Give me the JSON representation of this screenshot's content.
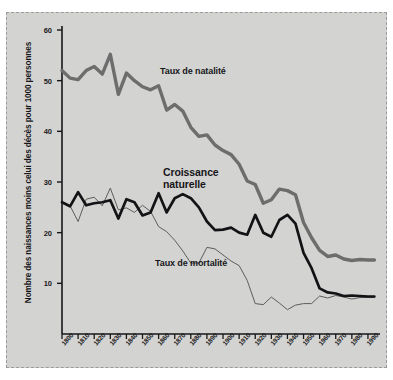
{
  "figure": {
    "caption_top": "",
    "background_color": "#d3d3d1",
    "border_style": "dashed"
  },
  "chart_data": {
    "type": "line",
    "title": "",
    "subtitle": "",
    "xlabel": "",
    "ylabel": "Nombre des naissances moins celui des décès pour 1000 personnes",
    "xlim": [
      1800,
      1995
    ],
    "ylim": [
      0,
      60
    ],
    "yticks": [
      10,
      20,
      30,
      40,
      50,
      60
    ],
    "ytick_labels": [
      "10",
      "20",
      "30",
      "40",
      "50",
      "60"
    ],
    "grid": false,
    "legend_position": "inline-annotations",
    "x": [
      1800,
      1810,
      1820,
      1830,
      1840,
      1850,
      1860,
      1870,
      1880,
      1890,
      1900,
      1910,
      1920,
      1930,
      1940,
      1950,
      1960,
      1970,
      1980,
      1990
    ],
    "xtick_labels": [
      "1800",
      "1810",
      "1820",
      "1830",
      "1840",
      "1850",
      "1860",
      "1870",
      "1880",
      "1890",
      "1900",
      "1910",
      "1920",
      "1930",
      "1940",
      "1950",
      "1960",
      "1970",
      "1980",
      "1990"
    ],
    "series": [
      {
        "name": "Taux de natalité",
        "label": "Taux de natalité",
        "color": "#6d6d6d",
        "line_width": 3.4,
        "x": [
          1800,
          1805,
          1810,
          1815,
          1820,
          1825,
          1830,
          1835,
          1840,
          1845,
          1850,
          1855,
          1860,
          1865,
          1870,
          1875,
          1880,
          1885,
          1890,
          1895,
          1900,
          1905,
          1910,
          1915,
          1920,
          1925,
          1930,
          1935,
          1940,
          1945,
          1950,
          1955,
          1960,
          1965,
          1970,
          1975,
          1980,
          1985,
          1990,
          1994
        ],
        "values": [
          52.0,
          50.5,
          50.2,
          52.0,
          52.8,
          51.3,
          55.2,
          47.3,
          51.5,
          50.0,
          48.8,
          48.2,
          49.0,
          44.2,
          45.3,
          44.0,
          40.8,
          39.0,
          39.3,
          37.3,
          36.2,
          35.4,
          33.5,
          30.2,
          29.5,
          25.8,
          26.5,
          28.6,
          28.3,
          27.5,
          22.0,
          19.0,
          16.5,
          15.3,
          15.6,
          14.8,
          14.5,
          14.7,
          14.6,
          14.6
        ]
      },
      {
        "name": "Croissance naturelle",
        "label": "Croissance naturelle",
        "color": "#131316",
        "line_width": 2.7,
        "x": [
          1800,
          1805,
          1810,
          1815,
          1820,
          1825,
          1830,
          1835,
          1840,
          1845,
          1850,
          1855,
          1860,
          1865,
          1870,
          1875,
          1880,
          1885,
          1890,
          1895,
          1900,
          1905,
          1910,
          1915,
          1920,
          1925,
          1930,
          1935,
          1940,
          1945,
          1950,
          1955,
          1960,
          1965,
          1970,
          1975,
          1980,
          1985,
          1990,
          1994
        ],
        "values": [
          26.0,
          25.2,
          28.0,
          25.4,
          25.8,
          26.0,
          26.4,
          22.8,
          26.6,
          26.0,
          23.4,
          24.0,
          27.8,
          24.0,
          26.8,
          27.6,
          26.8,
          25.0,
          22.2,
          20.5,
          20.6,
          21.0,
          20.0,
          19.6,
          23.5,
          20.0,
          19.2,
          22.5,
          23.5,
          21.8,
          16.0,
          13.0,
          9.0,
          8.2,
          8.0,
          7.5,
          7.6,
          7.5,
          7.4,
          7.4
        ]
      },
      {
        "name": "Taux de mortalité",
        "label": "Taux de mortalité",
        "color": "#5d5d5d",
        "line_width": 1.0,
        "x": [
          1800,
          1805,
          1810,
          1815,
          1820,
          1825,
          1830,
          1835,
          1840,
          1845,
          1850,
          1855,
          1860,
          1865,
          1870,
          1875,
          1880,
          1885,
          1890,
          1895,
          1900,
          1905,
          1910,
          1915,
          1920,
          1925,
          1930,
          1935,
          1940,
          1945,
          1950,
          1955,
          1960,
          1965,
          1970,
          1975,
          1980,
          1985,
          1990,
          1994
        ],
        "values": [
          26.0,
          25.3,
          22.2,
          26.6,
          27.0,
          25.3,
          28.8,
          24.5,
          24.9,
          24.0,
          25.4,
          24.2,
          21.2,
          20.2,
          18.5,
          16.4,
          14.0,
          14.0,
          17.1,
          16.8,
          15.6,
          14.4,
          13.5,
          10.6,
          6.0,
          5.8,
          7.3,
          6.1,
          4.8,
          5.7,
          6.0,
          6.0,
          7.5,
          7.1,
          7.6,
          7.3,
          6.9,
          7.2,
          7.2,
          7.2
        ]
      }
    ],
    "annotations": [
      {
        "text": "Taux de natalité",
        "x": 1860,
        "y": 49
      },
      {
        "text": "Croissance naturelle",
        "x": 1862,
        "y": 32
      },
      {
        "text": "Taux de mortalité",
        "x": 1858,
        "y": 16
      }
    ]
  }
}
